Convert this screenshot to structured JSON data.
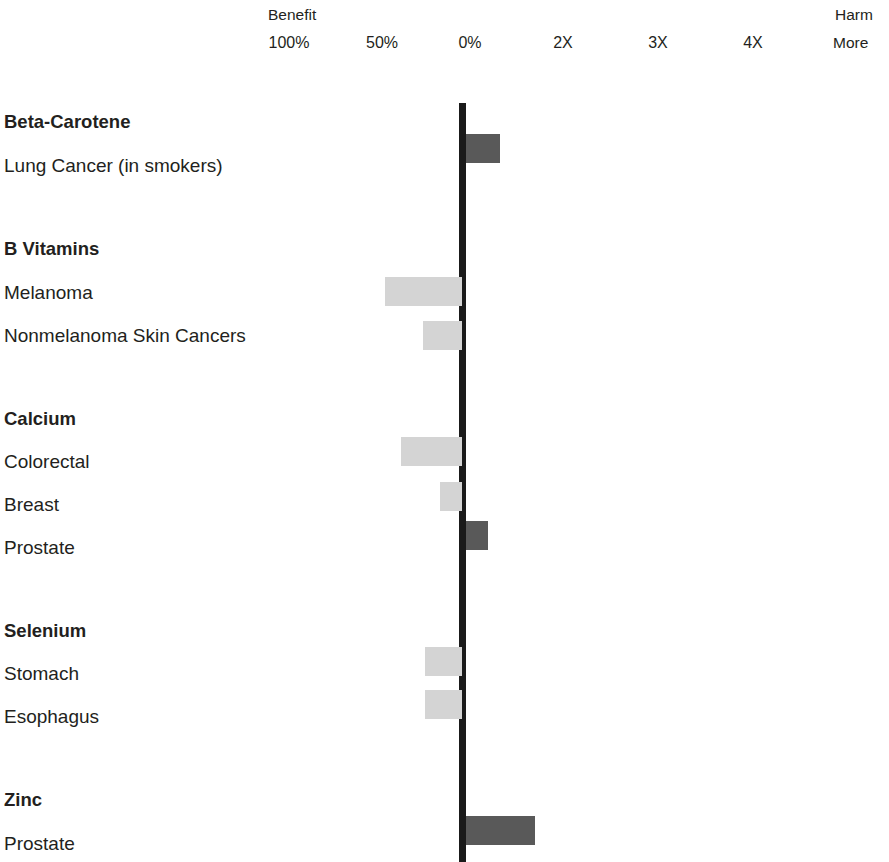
{
  "header": {
    "benefit_label": "Benefit",
    "harm_label": "Harm",
    "more_label": "More",
    "ticks": [
      {
        "label": "100%",
        "x": 289
      },
      {
        "label": "50%",
        "x": 382
      },
      {
        "label": "0%",
        "x": 470
      },
      {
        "label": "2X",
        "x": 563
      },
      {
        "label": "3X",
        "x": 658
      },
      {
        "label": "4X",
        "x": 753
      }
    ]
  },
  "chart_data": {
    "type": "bar",
    "orientation": "horizontal",
    "title": "",
    "subtitle": "",
    "xlabel": "",
    "ylabel": "",
    "grid": false,
    "legend": false,
    "axis_left_header": "Benefit",
    "axis_right_header": "Harm",
    "axis_right_sub": "More",
    "x_tick_labels": [
      "100%",
      "50%",
      "0%",
      "2X",
      "3X",
      "4X"
    ],
    "zero_at": "0%",
    "colors": {
      "benefit": "#d4d4d4",
      "harm": "#595959",
      "axis": "#1a1a1a",
      "text": "#231f20",
      "background": "#ffffff"
    },
    "groups": [
      {
        "name": "Beta-Carotene",
        "rows": [
          {
            "label": "Lung Cancer (in smokers)",
            "direction": "harm",
            "magnitude_px": 34,
            "value_text": ""
          }
        ]
      },
      {
        "name": "B Vitamins",
        "rows": [
          {
            "label": "Melanoma",
            "direction": "benefit",
            "magnitude_px": 77,
            "value_text": ""
          },
          {
            "label": "Nonmelanoma Skin Cancers",
            "direction": "benefit",
            "magnitude_px": 39,
            "value_text": ""
          }
        ]
      },
      {
        "name": "Calcium",
        "rows": [
          {
            "label": "Colorectal",
            "direction": "benefit",
            "magnitude_px": 61,
            "value_text": ""
          },
          {
            "label": "Breast",
            "direction": "benefit",
            "magnitude_px": 22,
            "value_text": ""
          },
          {
            "label": "Prostate",
            "direction": "harm",
            "magnitude_px": 22,
            "value_text": ""
          }
        ]
      },
      {
        "name": "Selenium",
        "rows": [
          {
            "label": "Stomach",
            "direction": "benefit",
            "magnitude_px": 37,
            "value_text": ""
          },
          {
            "label": "Esophagus",
            "direction": "benefit",
            "magnitude_px": 37,
            "value_text": ""
          }
        ]
      },
      {
        "name": "Zinc",
        "rows": [
          {
            "label": "Prostate",
            "direction": "harm",
            "magnitude_px": 69,
            "value_text": ""
          }
        ]
      }
    ]
  },
  "layout": {
    "zero_x": 459,
    "zero_w": 7,
    "label_rows": [
      {
        "key": "g-beta",
        "text": "Beta-Carotene",
        "top": 113,
        "bold": true
      },
      {
        "key": "r-lung",
        "text": "Lung Cancer (in smokers)",
        "top": 156,
        "bold": false
      },
      {
        "key": "g-bvit",
        "text": "B Vitamins",
        "top": 240,
        "bold": true
      },
      {
        "key": "r-melanoma",
        "text": "Melanoma",
        "top": 283,
        "bold": false
      },
      {
        "key": "r-nonmelanoma",
        "text": "Nonmelanoma Skin Cancers",
        "top": 326,
        "bold": false
      },
      {
        "key": "g-calcium",
        "text": "Calcium",
        "top": 410,
        "bold": true
      },
      {
        "key": "r-colorectal",
        "text": "Colorectal",
        "top": 452,
        "bold": false
      },
      {
        "key": "r-breast",
        "text": "Breast",
        "top": 495,
        "bold": false
      },
      {
        "key": "r-prostate-ca",
        "text": "Prostate",
        "top": 538,
        "bold": false
      },
      {
        "key": "g-selenium",
        "text": "Selenium",
        "top": 622,
        "bold": true
      },
      {
        "key": "r-stomach",
        "text": "Stomach",
        "top": 664,
        "bold": false
      },
      {
        "key": "r-esophagus",
        "text": "Esophagus",
        "top": 707,
        "bold": false
      },
      {
        "key": "g-zinc",
        "text": "Zinc",
        "top": 791,
        "bold": true
      },
      {
        "key": "r-prostate-zn",
        "text": "Prostate",
        "top": 834,
        "bold": false
      }
    ],
    "bars": [
      {
        "key": "bar-lung",
        "direction": "harm",
        "w": 34,
        "top": 134
      },
      {
        "key": "bar-melanoma",
        "direction": "benefit",
        "w": 77,
        "top": 277
      },
      {
        "key": "bar-nonmelanoma",
        "direction": "benefit",
        "w": 39,
        "top": 321
      },
      {
        "key": "bar-colorectal",
        "direction": "benefit",
        "w": 61,
        "top": 437
      },
      {
        "key": "bar-breast",
        "direction": "benefit",
        "w": 22,
        "top": 482
      },
      {
        "key": "bar-prostate-ca",
        "direction": "harm",
        "w": 22,
        "top": 521
      },
      {
        "key": "bar-stomach",
        "direction": "benefit",
        "w": 37,
        "top": 647
      },
      {
        "key": "bar-esophagus",
        "direction": "benefit",
        "w": 37,
        "top": 690
      },
      {
        "key": "bar-prostate-zn",
        "direction": "harm",
        "w": 69,
        "top": 816
      }
    ]
  }
}
